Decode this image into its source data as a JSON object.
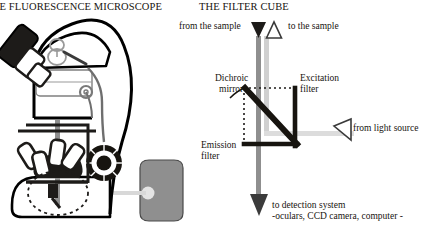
{
  "left": {
    "title": "IE FLUORESCENCE MICROSCOPE",
    "parts": {
      "eyepiece": "eyepiece",
      "body": "microscope-body",
      "turret": "objective-turret",
      "stage": "specimen-stage",
      "focus_knob": "focus-knob",
      "lamp_housing": "lamp-housing",
      "sample_highlight": "sample-highlight"
    }
  },
  "right": {
    "title": "THE FILTER CUBE",
    "labels": {
      "from_sample": "from the sample",
      "to_sample": "to the sample",
      "dichroic_mirror_line1": "Dichroic",
      "dichroic_mirror_line2": "mirror",
      "excitation_filter_line1": "Excitation",
      "excitation_filter_line2": "filter",
      "emission_filter_line1": "Emission",
      "emission_filter_line2": "filter",
      "from_light_source": "from light source",
      "to_detection_line1": "to detection system",
      "to_detection_line2": "-oculars, CCD camera, computer -"
    },
    "icons": {
      "down_arrow_from_sample": "triangle-down-filled-icon",
      "up_arrow_to_sample": "triangle-up-outline-icon",
      "left_arrow_light_source": "triangle-left-outline-icon",
      "down_arrow_detection": "triangle-down-filled-icon"
    }
  },
  "colors": {
    "ink": "#17140f",
    "dark": "#211f1d",
    "beam_gray": "#9a9a9a",
    "beam_light": "#d8d8d8",
    "lamp_gray": "#8f8f8f",
    "outline": "#000000",
    "page_bg": "#ffffff"
  }
}
